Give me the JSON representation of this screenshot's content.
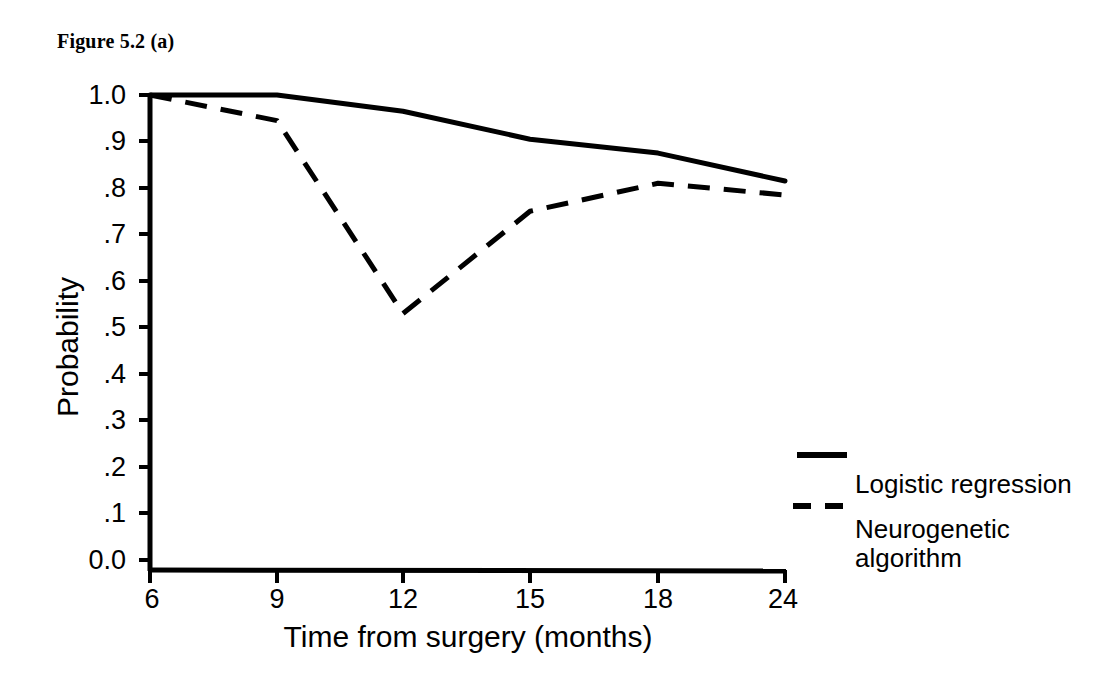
{
  "figure": {
    "caption": "Figure 5.2 (a)"
  },
  "chart_data": {
    "type": "line",
    "title": "Figure 5.2 (a)",
    "xlabel": "Time from surgery (months)",
    "ylabel": "Probability",
    "categories": [
      "6",
      "9",
      "12",
      "15",
      "18",
      "24"
    ],
    "x": [
      6,
      9,
      12,
      15,
      18,
      24
    ],
    "x_spacing": "categorical-equal",
    "xtick_labels": [
      "6",
      "9",
      "12",
      "15",
      "18",
      "24"
    ],
    "ytick_labels": [
      "1.0",
      ".9",
      ".8",
      ".7",
      ".6",
      ".5",
      ".4",
      ".3",
      ".2",
      ".1",
      "0.0"
    ],
    "ytick_values": [
      1.0,
      0.9,
      0.8,
      0.7,
      0.6,
      0.5,
      0.4,
      0.3,
      0.2,
      0.1,
      0.0
    ],
    "ylim": [
      0.0,
      1.0
    ],
    "grid": false,
    "legend_position": "right",
    "series": [
      {
        "name": "Logistic regression",
        "style": "solid",
        "color": "#000000",
        "values": [
          1.0,
          1.0,
          0.965,
          0.905,
          0.875,
          0.815
        ]
      },
      {
        "name": "Neurogenetic algorithm",
        "style": "dashed",
        "color": "#000000",
        "values": [
          1.0,
          0.945,
          0.53,
          0.75,
          0.81,
          0.785
        ]
      }
    ]
  },
  "legend": {
    "entries": [
      {
        "label": "Logistic regression",
        "style": "solid"
      },
      {
        "label": "Neurogenetic\nalgorithm",
        "style": "dashed"
      }
    ]
  },
  "colors": {
    "ink": "#000000",
    "background": "#ffffff"
  }
}
